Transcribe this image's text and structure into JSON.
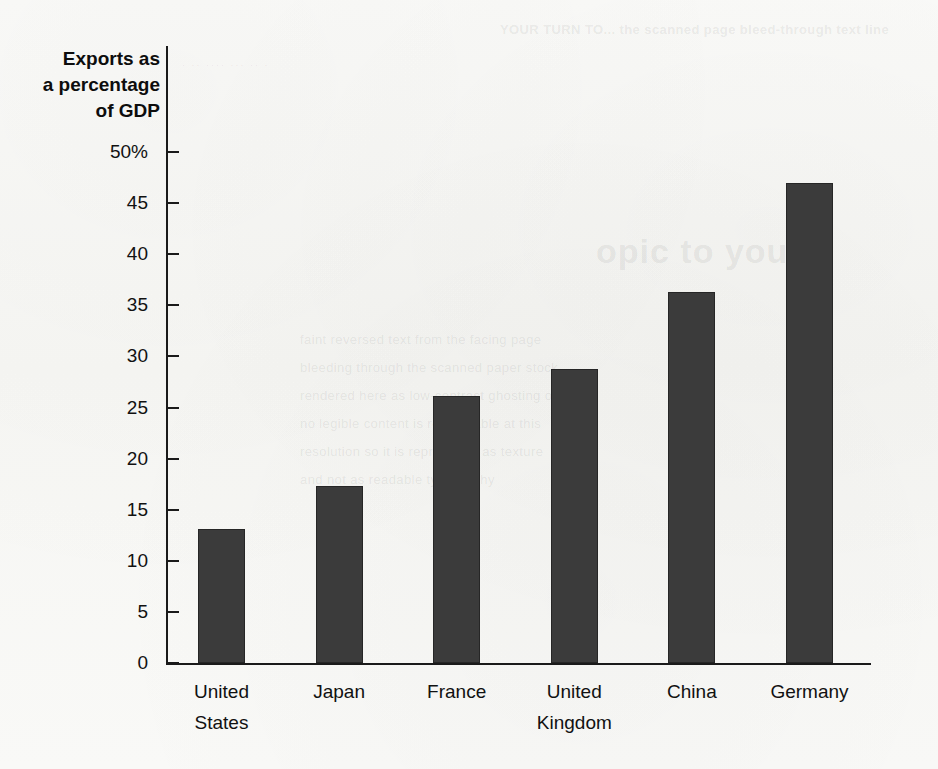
{
  "chart_data": {
    "type": "bar",
    "title": "",
    "ylabel": "Exports as a percentage of GDP",
    "ylabel_lines": [
      "Exports as",
      "a percentage",
      "of GDP"
    ],
    "xlabel": "",
    "categories": [
      "United States",
      "Japan",
      "France",
      "United Kingdom",
      "China",
      "Germany"
    ],
    "category_lines": [
      [
        "United",
        "States"
      ],
      [
        "Japan",
        ""
      ],
      [
        "France",
        ""
      ],
      [
        "United",
        "Kingdom"
      ],
      [
        "China",
        ""
      ],
      [
        "Germany",
        ""
      ]
    ],
    "values": [
      13.1,
      17.3,
      26.1,
      28.8,
      36.3,
      47.0
    ],
    "ylim": [
      0,
      50
    ],
    "ytick_values": [
      50,
      45,
      40,
      35,
      30,
      25,
      20,
      15,
      10,
      5,
      0
    ],
    "ytick_labels": [
      "50%",
      "45",
      "40",
      "35",
      "30",
      "25",
      "20",
      "15",
      "10",
      "5",
      "0"
    ],
    "grid": false,
    "legend": null,
    "bar_color": "#3b3b3b",
    "bar_border_color": "#262626",
    "axis_color": "#1a1a1a",
    "background_color": "#f8f8f6"
  },
  "artifacts": {
    "bleed_top_right": "YOUR TURN TO... the scanned page bleed-through text line",
    "bleed_mid_right": "opic to your",
    "bleed_body": [
      "faint reversed text from the facing page",
      "bleeding through the scanned paper stock",
      "rendered here as low-contrast ghosting only",
      "no legible content is recoverable at this",
      "resolution so it is reproduced as texture",
      "and not as readable typography"
    ],
    "bleed_streak": "· ·· ···· ··· ·· ·"
  }
}
